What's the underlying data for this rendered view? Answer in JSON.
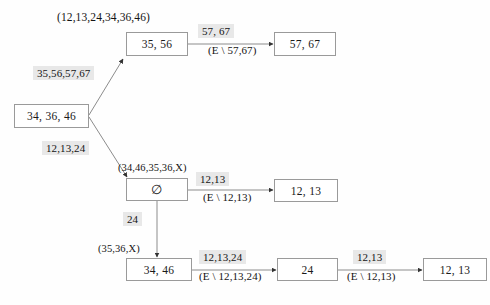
{
  "diagram": {
    "background_color": "#fefefe",
    "node_border_color": "#9a9a9a",
    "highlight_color": "#e8e8e8",
    "text_color": "#1a1a1a"
  },
  "nodes": {
    "root": "34, 36, 46",
    "upper_mid": "35, 56",
    "upper_right": "57, 67",
    "lower_mid": "∅",
    "lower_right": "12, 13",
    "bottom_left": "34, 46",
    "bottom_mid": "24",
    "bottom_right": "12, 13"
  },
  "labels": {
    "top_universe": "(12,13,24,34,36,46)",
    "upper_branch": "35,56,57,67",
    "lower_branch": "12,13,24",
    "upper_right_top": "57, 67",
    "upper_right_bottom": "(E \\ 57,67)",
    "lower_node_tag": "(34,46,35,36,X)",
    "lower_right_top": "12,13",
    "lower_right_bottom": "(E \\ 12,13)",
    "vertical_edge": "24",
    "bottom_node_tag": "(35,36,X)",
    "bottom_first_top": "12,13,24",
    "bottom_first_bottom": "(E \\ 12,13,24)",
    "bottom_second_top": "12,13",
    "bottom_second_bottom": "(E \\ 12,13)"
  }
}
